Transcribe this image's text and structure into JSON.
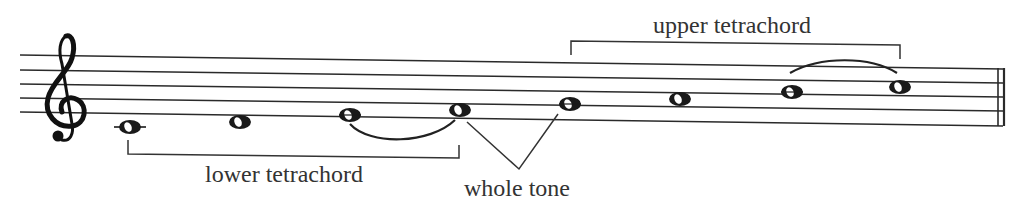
{
  "labels": {
    "upper": "upper tetrachord",
    "lower": "lower tetrachord",
    "whole_tone": "whole tone"
  },
  "clef": "treble-clef",
  "notes": [
    {
      "index": 1,
      "name": "C4",
      "x": 130,
      "y": 127,
      "ledger": true
    },
    {
      "index": 2,
      "name": "D4",
      "x": 240,
      "y": 122,
      "ledger": false
    },
    {
      "index": 3,
      "name": "E4",
      "x": 350,
      "y": 115,
      "ledger": false
    },
    {
      "index": 4,
      "name": "F4",
      "x": 460,
      "y": 110,
      "ledger": false
    },
    {
      "index": 5,
      "name": "G4",
      "x": 570,
      "y": 104,
      "ledger": false
    },
    {
      "index": 6,
      "name": "A4",
      "x": 680,
      "y": 99,
      "ledger": false
    },
    {
      "index": 7,
      "name": "B4",
      "x": 792,
      "y": 92,
      "ledger": false
    },
    {
      "index": 8,
      "name": "C5",
      "x": 900,
      "y": 87,
      "ledger": false
    }
  ],
  "colors": {
    "ink": "#1a1a1a",
    "text": "#333333",
    "background": "#ffffff"
  }
}
